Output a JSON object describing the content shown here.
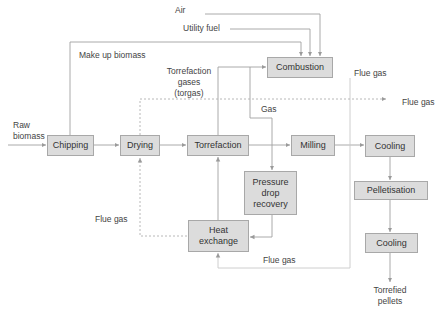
{
  "diagram": {
    "type": "process-flow",
    "nodes": {
      "chipping": "Chipping",
      "drying": "Drying",
      "torrefaction": "Torrefaction",
      "milling": "Milling",
      "cooling1": "Cooling",
      "combustion": "Combustion",
      "pressure_drop": "Pressure drop recovery",
      "heat_exchange": "Heat exchange",
      "pelletisation": "Pelletisation",
      "cooling2": "Cooling"
    },
    "labels": {
      "air": "Air",
      "utility_fuel": "Utility fuel",
      "make_up_biomass": "Make up biomass",
      "torgas_line1": "Torrefaction",
      "torgas_line2": "gases",
      "torgas_line3": "(torgas)",
      "flue_gas_top": "Flue gas",
      "flue_gas_right": "Flue gas",
      "gas": "Gas",
      "raw_line1": "Raw",
      "raw_line2": "biomass",
      "flue_gas_left": "Flue gas",
      "flue_gas_bottom": "Flue gas",
      "product_line1": "Torrefied",
      "product_line2": "pellets"
    },
    "edges": [
      {
        "from": "Raw biomass",
        "to": "Chipping"
      },
      {
        "from": "Chipping",
        "to": "Drying"
      },
      {
        "from": "Drying",
        "to": "Torrefaction"
      },
      {
        "from": "Torrefaction",
        "to": "Milling"
      },
      {
        "from": "Milling",
        "to": "Cooling"
      },
      {
        "from": "Cooling",
        "to": "Pelletisation"
      },
      {
        "from": "Pelletisation",
        "to": "Cooling"
      },
      {
        "from": "Cooling",
        "to": "Torrefied pellets"
      },
      {
        "from": "Chipping",
        "to": "Combustion",
        "label": "Make up biomass"
      },
      {
        "from": "Air",
        "to": "Combustion"
      },
      {
        "from": "Utility fuel",
        "to": "Combustion"
      },
      {
        "from": "Torrefaction",
        "to": "Combustion",
        "label": "Torrefaction gases (torgas)"
      },
      {
        "from": "Combustion",
        "to": "Pressure drop recovery",
        "label": "Gas"
      },
      {
        "from": "Pressure drop recovery",
        "to": "Heat exchange"
      },
      {
        "from": "Heat exchange",
        "to": "Torrefaction"
      },
      {
        "from": "Heat exchange",
        "to": "Drying",
        "label": "Flue gas",
        "style": "dotted"
      },
      {
        "from": "Drying",
        "to": "Flue gas (out)",
        "style": "dotted"
      },
      {
        "from": "Combustion",
        "to": "Heat exchange",
        "label": "Flue gas"
      }
    ]
  }
}
